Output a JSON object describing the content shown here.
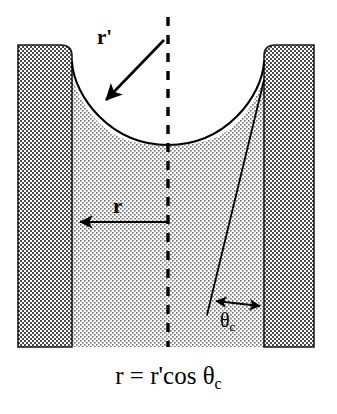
{
  "figure": {
    "title_caption": "r = r'cos θc",
    "caption_parts": {
      "lhs": "r",
      "equals": "=",
      "rhs_prefix": "r'cos",
      "theta": "θ",
      "theta_subscript": "c"
    },
    "labels": {
      "r_prime": "r'",
      "r": "r",
      "theta": "θ",
      "theta_subscript": "c"
    },
    "colors": {
      "background": "#ffffff",
      "wall_fill": "#8c8c8c",
      "liquid_fill": "#d2d2d2",
      "line": "#000000",
      "dash_line": "#000000"
    },
    "geometry": {
      "left_wall": {
        "x": 18,
        "y": 45,
        "width": 54,
        "height": 302,
        "corner_radius": 11
      },
      "right_wall": {
        "x": 264,
        "y": 45,
        "width": 50,
        "height": 302,
        "corner_radius": 11
      },
      "liquid_region": {
        "left": 72,
        "right": 264,
        "top": 45,
        "bottom": 347
      },
      "meniscus": {
        "left_contact_x": 72,
        "right_contact_x": 264,
        "contact_y": 78,
        "bottom_y": 145,
        "center_x": 168
      },
      "center_dash_line": {
        "x": 168,
        "y_top": 17,
        "y_bottom": 347
      },
      "r_arrow": {
        "from_x": 168,
        "to_x": 74,
        "y": 222
      },
      "r_prime_arrow": {
        "from_x": 164,
        "to_x": 104,
        "from_y": 40,
        "to_y": 102
      },
      "tangent_line": {
        "x1": 264,
        "y1": 80,
        "x2": 207,
        "y2": 315
      },
      "theta_arrow": {
        "left_x": 211,
        "right_x": 263,
        "y": 303
      }
    }
  }
}
